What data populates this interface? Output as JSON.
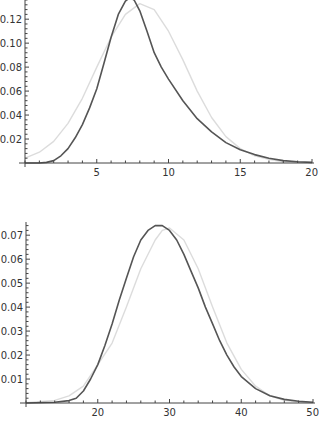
{
  "chart_data": [
    {
      "type": "line",
      "title": "",
      "xlabel": "",
      "ylabel": "",
      "xlim": [
        0,
        20
      ],
      "ylim": [
        0,
        0.136
      ],
      "grid": false,
      "legend": null,
      "x_ticks": [
        5,
        10,
        15,
        20
      ],
      "y_ticks": [
        0.02,
        0.04,
        0.06,
        0.08,
        0.1,
        0.12
      ],
      "y_tick_labels": [
        "0.02",
        "0.04",
        "0.06",
        "0.08",
        "0.10",
        "0.12"
      ],
      "series": [
        {
          "name": "exact distribution",
          "color": "#555555",
          "x": [
            0,
            1,
            1.5,
            2,
            2.5,
            3,
            3.5,
            4,
            4.5,
            5,
            5.5,
            6,
            6.5,
            7,
            7.3,
            7.6,
            8,
            8.5,
            9,
            9.5,
            10,
            11,
            12,
            13,
            14,
            15,
            16,
            17,
            18,
            19,
            20
          ],
          "values": [
            0,
            0,
            0.0005,
            0.002,
            0.006,
            0.012,
            0.021,
            0.032,
            0.046,
            0.062,
            0.083,
            0.105,
            0.124,
            0.135,
            0.138,
            0.136,
            0.127,
            0.11,
            0.092,
            0.08,
            0.07,
            0.052,
            0.037,
            0.026,
            0.017,
            0.011,
            0.007,
            0.004,
            0.002,
            0.001,
            0.0005
          ]
        },
        {
          "name": "normal approximation",
          "color": "#dcdcdc",
          "x": [
            0,
            1,
            2,
            3,
            4,
            5,
            6,
            7,
            8,
            9,
            10,
            11,
            12,
            13,
            14,
            15,
            16,
            17,
            18,
            19,
            20
          ],
          "values": [
            0.004,
            0.009,
            0.018,
            0.033,
            0.054,
            0.08,
            0.105,
            0.124,
            0.133,
            0.128,
            0.11,
            0.086,
            0.06,
            0.038,
            0.022,
            0.012,
            0.006,
            0.003,
            0.001,
            0.0005,
            0.0002
          ]
        }
      ]
    },
    {
      "type": "line",
      "title": "",
      "xlabel": "",
      "ylabel": "",
      "xlim": [
        10,
        50
      ],
      "ylim": [
        0,
        0.0755
      ],
      "grid": false,
      "legend": null,
      "x_ticks": [
        20,
        30,
        40,
        50
      ],
      "y_ticks": [
        0.01,
        0.02,
        0.03,
        0.04,
        0.05,
        0.06,
        0.07
      ],
      "y_tick_labels": [
        "0.01",
        "0.02",
        "0.03",
        "0.04",
        "0.05",
        "0.06",
        "0.07"
      ],
      "series": [
        {
          "name": "exact distribution",
          "color": "#555555",
          "x": [
            10,
            14,
            16,
            17,
            18,
            19,
            20,
            21,
            22,
            23,
            24,
            25,
            26,
            27,
            28,
            29,
            30,
            31,
            32,
            33,
            34,
            35,
            36,
            37,
            38,
            39,
            40,
            42,
            44,
            46,
            48,
            50
          ],
          "values": [
            0,
            0.0003,
            0.001,
            0.002,
            0.005,
            0.01,
            0.016,
            0.024,
            0.033,
            0.043,
            0.052,
            0.061,
            0.068,
            0.072,
            0.074,
            0.074,
            0.072,
            0.068,
            0.062,
            0.055,
            0.048,
            0.04,
            0.033,
            0.026,
            0.02,
            0.015,
            0.011,
            0.006,
            0.003,
            0.0015,
            0.0007,
            0.0003
          ]
        },
        {
          "name": "normal approximation",
          "color": "#dcdcdc",
          "x": [
            10,
            14,
            16,
            18,
            20,
            22,
            24,
            26,
            28,
            29,
            30,
            32,
            34,
            36,
            38,
            40,
            42,
            44,
            46,
            48,
            50
          ],
          "values": [
            0.0001,
            0.0011,
            0.003,
            0.007,
            0.016,
            0.025,
            0.04,
            0.056,
            0.068,
            0.072,
            0.073,
            0.068,
            0.056,
            0.04,
            0.025,
            0.014,
            0.007,
            0.003,
            0.0011,
            0.0004,
            0.0001
          ]
        }
      ]
    }
  ],
  "caption": {
    "text": "dens gr ity.dacd:kte dt s  9  40    ,    ,   lt     ,   rms  , d   lt     tt   ist   "
  }
}
